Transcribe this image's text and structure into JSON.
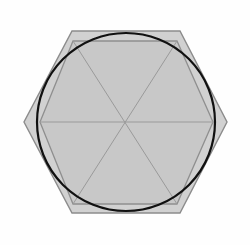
{
  "canvas": {
    "width": 250,
    "height": 245,
    "background_color": "#fefefe",
    "title": "Hexagon and inscribed circle geometric figure"
  },
  "palette": {
    "fill_gray": "#c9c9c9",
    "fill_gray_overlap": "#c2c2c2",
    "stroke_gray": "#8c8c8c",
    "stroke_gray_light": "#a0a0a0",
    "stroke_black": "#111111",
    "background": "#fefefe"
  },
  "shapes": {
    "outer_hexagon": {
      "name": "outer-hexagon",
      "orientation": "pointy-left-right",
      "center": {
        "x": 126,
        "y": 122
      },
      "vertices": [
        {
          "x": 72,
          "y": 31
        },
        {
          "x": 180,
          "y": 31
        },
        {
          "x": 227,
          "y": 122
        },
        {
          "x": 180,
          "y": 213
        },
        {
          "x": 72,
          "y": 213
        },
        {
          "x": 24,
          "y": 122
        }
      ],
      "fill": "#c9c9c9",
      "stroke": "#8c8c8c",
      "stroke_width": 1.4,
      "fill_opacity": 0.85
    },
    "inner_hexagon": {
      "name": "inner-hexagon",
      "orientation": "flat-top",
      "center": {
        "x": 126,
        "y": 122
      },
      "vertices": [
        {
          "x": 73,
          "y": 41
        },
        {
          "x": 177,
          "y": 41
        },
        {
          "x": 213,
          "y": 122
        },
        {
          "x": 177,
          "y": 204
        },
        {
          "x": 73,
          "y": 204
        },
        {
          "x": 40,
          "y": 122
        }
      ],
      "fill": "#c6c6c6",
      "stroke": "#8f8f8f",
      "stroke_width": 1.3,
      "fill_opacity": 0.8
    },
    "circle": {
      "name": "circumscribed-circle",
      "center": {
        "x": 126,
        "y": 122
      },
      "radius": 89,
      "fill": "none",
      "stroke": "#111111",
      "stroke_width": 2.2
    },
    "diagonals": {
      "name": "hexagon-diagonals",
      "description": "Three long diagonals through the center dividing the inner hexagon into six triangles",
      "stroke": "#9a9a9a",
      "stroke_width": 1.0,
      "lines": [
        {
          "x1": 40,
          "y1": 122,
          "x2": 213,
          "y2": 122
        },
        {
          "x1": 73,
          "y1": 41,
          "x2": 177,
          "y2": 204
        },
        {
          "x1": 177,
          "y1": 41,
          "x2": 73,
          "y2": 204
        }
      ]
    },
    "center_point": {
      "name": "center-point",
      "x": 126,
      "y": 122
    }
  },
  "geometry_facts": {
    "triangle_count": 6,
    "hexagon_count": 2,
    "circle_count": 1
  }
}
